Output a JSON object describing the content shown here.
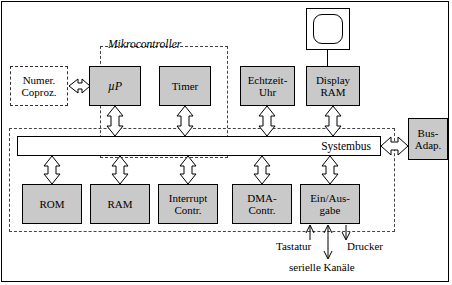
{
  "diagram": {
    "title_caption": "Mikrocontroller",
    "bus_label": "Systembus",
    "boxes": {
      "coprocessor": "Numer.\nCoproz.",
      "cpu": "µP",
      "timer": "Timer",
      "rtc": "Echtzeit-\nUhr",
      "display_ram": "Display\nRAM",
      "bus_adapter": "Bus-\nAdap.",
      "rom": "ROM",
      "ram": "RAM",
      "interrupt_controller": "Interrupt\nContr.",
      "dma_controller": "DMA-\nContr.",
      "io": "Ein/Aus-\ngabe"
    },
    "peripheral_labels": {
      "keyboard": "Tastatur",
      "printer": "Drucker",
      "serial_channels": "serielle Kanäle"
    },
    "colors": {
      "box_fill": "#c9c9c9",
      "stroke": "#000000",
      "dashed_stroke": "#444444",
      "background": "#ffffff"
    }
  }
}
